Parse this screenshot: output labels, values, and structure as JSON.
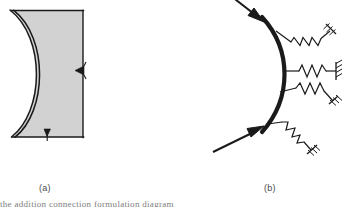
{
  "figure": {
    "background_color": "#ffffff",
    "line_color": "#1a1a1a",
    "fill_color": "#d2d2d2",
    "caption_color": "#4a4a4a",
    "panels": [
      {
        "id": "a",
        "label": "(a)",
        "description": "shaded body with concave double-line boundary arc and two small inward arrowheads"
      },
      {
        "id": "b",
        "label": "(b)",
        "description": "thick convex arc loaded by two large inward arrows and supported by four springs anchored to hatched fixed supports"
      }
    ],
    "panel_a": {
      "label": "(a)",
      "fill_color": "#d2d2d2",
      "stroke_color": "#1a1a1a",
      "arrow_count": 2,
      "arrows": [
        {
          "name": "right-edge-arrowhead",
          "direction": "left"
        },
        {
          "name": "bottom-edge-arrowhead",
          "direction": "up"
        }
      ],
      "boundary": "double-line concave arc on the left side"
    },
    "panel_b": {
      "label": "(b)",
      "stroke_color": "#1a1a1a",
      "arc_thickness_px": 4,
      "load_arrows": [
        {
          "name": "upper-load-arrow",
          "direction": "down-right"
        },
        {
          "name": "lower-load-arrow",
          "direction": "up-right"
        }
      ],
      "springs": [
        {
          "name": "spring-1",
          "orientation": "upper-diagonal"
        },
        {
          "name": "spring-2",
          "orientation": "horizontal"
        },
        {
          "name": "spring-3",
          "orientation": "lower-diagonal"
        },
        {
          "name": "spring-4",
          "orientation": "lower-steep-diagonal"
        }
      ],
      "support_type": "hatched fixed support"
    },
    "bottom_caption_clipped": "the addition connection formulation diagram"
  }
}
